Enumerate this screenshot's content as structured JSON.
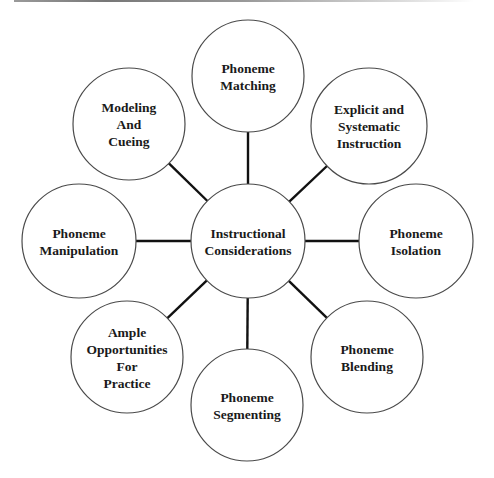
{
  "diagram": {
    "type": "hub-and-spoke",
    "center": {
      "id": "instructional-considerations",
      "lines": [
        "Instructional",
        "Considerations"
      ],
      "x": 248,
      "y": 241,
      "r": 57
    },
    "nodes": [
      {
        "id": "phoneme-matching",
        "lines": [
          "Phoneme",
          "Matching"
        ],
        "x": 248,
        "y": 76,
        "r": 56
      },
      {
        "id": "explicit-systematic-instruction",
        "lines": [
          "Explicit and",
          "Systematic",
          "Instruction"
        ],
        "x": 369,
        "y": 126,
        "r": 58
      },
      {
        "id": "phoneme-isolation",
        "lines": [
          "Phoneme",
          "Isolation"
        ],
        "x": 416,
        "y": 241,
        "r": 57
      },
      {
        "id": "phoneme-blending",
        "lines": [
          "Phoneme",
          "Blending"
        ],
        "x": 367,
        "y": 357,
        "r": 56
      },
      {
        "id": "phoneme-segmenting",
        "lines": [
          "Phoneme",
          "Segmenting"
        ],
        "x": 247,
        "y": 405,
        "r": 56
      },
      {
        "id": "ample-opportunities-for-practice",
        "lines": [
          "Ample",
          "Opportunities",
          "For",
          "Practice"
        ],
        "x": 127,
        "y": 357,
        "r": 56
      },
      {
        "id": "phoneme-manipulation",
        "lines": [
          "Phoneme",
          "Manipulation"
        ],
        "x": 79,
        "y": 241,
        "r": 57
      },
      {
        "id": "modeling-and-cueing",
        "lines": [
          "Modeling",
          "And",
          "Cueing"
        ],
        "x": 129,
        "y": 124,
        "r": 56
      }
    ],
    "colors": {
      "background": "#ffffff",
      "circle_stroke": "#4a4a4a",
      "connector": "#111111",
      "text": "#1a1a1a"
    }
  }
}
